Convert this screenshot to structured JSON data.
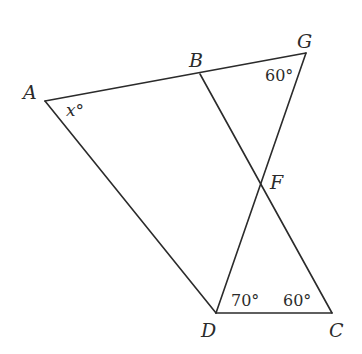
{
  "diagram": {
    "type": "geometry",
    "points": {
      "A": {
        "label": "A",
        "x": 45,
        "y": 101
      },
      "B": {
        "label": "B",
        "x": 200,
        "y": 74
      },
      "G": {
        "label": "G",
        "x": 306,
        "y": 53
      },
      "F": {
        "label": "F",
        "x": 261,
        "y": 190
      },
      "D": {
        "label": "D",
        "x": 216,
        "y": 313
      },
      "C": {
        "label": "C",
        "x": 332,
        "y": 313
      }
    },
    "segments": [
      {
        "id": "AG",
        "from": "A",
        "to": "G"
      },
      {
        "id": "AD",
        "from": "A",
        "to": "D"
      },
      {
        "id": "BC",
        "from": "B",
        "to": "C"
      },
      {
        "id": "GD",
        "from": "G",
        "to": "D"
      },
      {
        "id": "DC",
        "from": "D",
        "to": "C"
      }
    ],
    "angles": {
      "A": {
        "value": "x",
        "unit": "°",
        "text": "x°"
      },
      "G": {
        "value": "60",
        "unit": "°",
        "text": "60°"
      },
      "D": {
        "value": "70",
        "unit": "°",
        "text": "70°"
      },
      "C": {
        "value": "60",
        "unit": "°",
        "text": "60°"
      }
    },
    "colors": {
      "line": "#2b2b2b",
      "background": "#ffffff"
    }
  }
}
